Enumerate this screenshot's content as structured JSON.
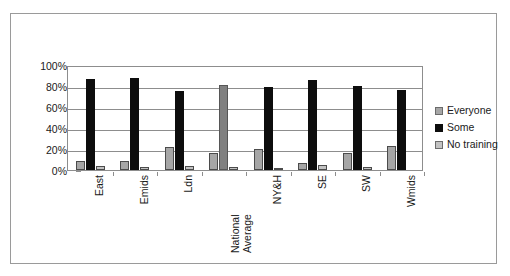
{
  "chart_data": {
    "type": "bar",
    "title": "",
    "xlabel": "",
    "ylabel": "",
    "ylim": [
      0,
      100
    ],
    "ytick_labels": [
      "100%",
      "80%",
      "60%",
      "40%",
      "20%",
      "0%"
    ],
    "ytick_values": [
      100,
      80,
      60,
      40,
      20,
      0
    ],
    "grid": true,
    "legend_position": "right",
    "categories": [
      "East",
      "Emids",
      "Ldn",
      "National Average",
      "NY&H",
      "SE",
      "SW",
      "Wmids"
    ],
    "category_lines": [
      [
        "East"
      ],
      [
        "Emids"
      ],
      [
        "Ldn"
      ],
      [
        "National",
        "Average"
      ],
      [
        "NY&H"
      ],
      [
        "SE"
      ],
      [
        "SW"
      ],
      [
        "Wmids"
      ]
    ],
    "series": [
      {
        "name": "Everyone",
        "color": "#a6a6a6",
        "values": [
          9,
          9,
          22,
          16,
          20,
          7,
          16,
          23
        ]
      },
      {
        "name": "Some",
        "color": "#0d0d0d",
        "values": [
          87,
          88,
          75,
          81,
          79,
          86,
          80,
          76
        ],
        "muted_indices": [
          3
        ],
        "muted_color": "#808080"
      },
      {
        "name": "No training",
        "color": "#c2c2c2",
        "values": [
          4,
          3,
          3.5,
          2.5,
          1.5,
          5,
          2.5,
          0
        ]
      }
    ]
  },
  "legend": {
    "items": [
      {
        "label": "Everyone",
        "swatch": "everyone"
      },
      {
        "label": "Some",
        "swatch": "some"
      },
      {
        "label": "No training",
        "swatch": "none"
      }
    ]
  }
}
